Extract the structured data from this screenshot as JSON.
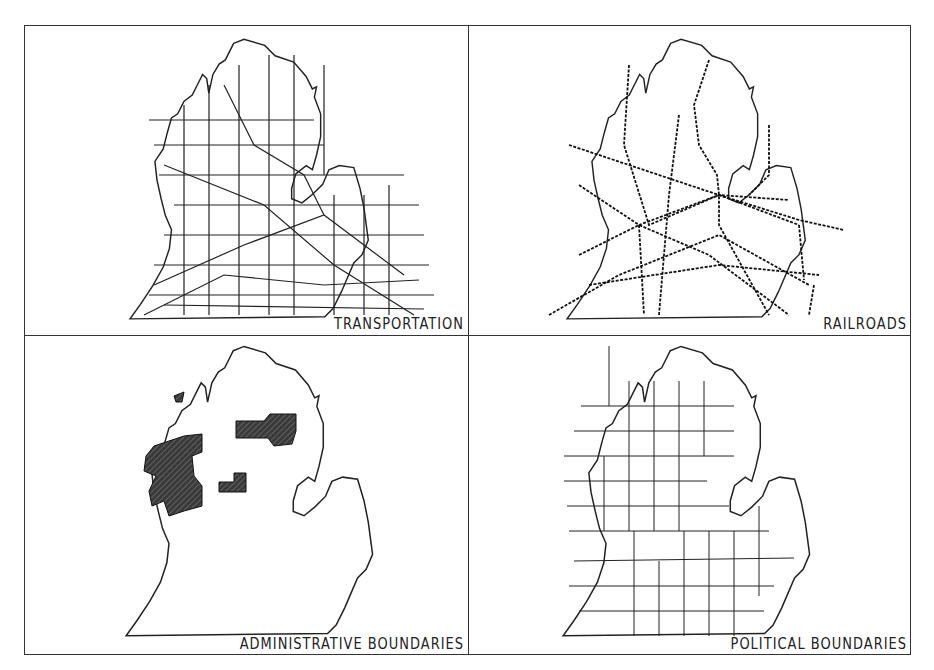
{
  "figure": {
    "panels": [
      {
        "id": "transportation",
        "label": "TRANSPORTATION"
      },
      {
        "id": "railroads",
        "label": "RAILROADS"
      },
      {
        "id": "administrative",
        "label": "ADMINISTRATIVE BOUNDARIES"
      },
      {
        "id": "political",
        "label": "POLITICAL BOUNDARIES"
      }
    ],
    "colors": {
      "line": "#222222",
      "fill": "#444444",
      "background": "#ffffff"
    }
  }
}
